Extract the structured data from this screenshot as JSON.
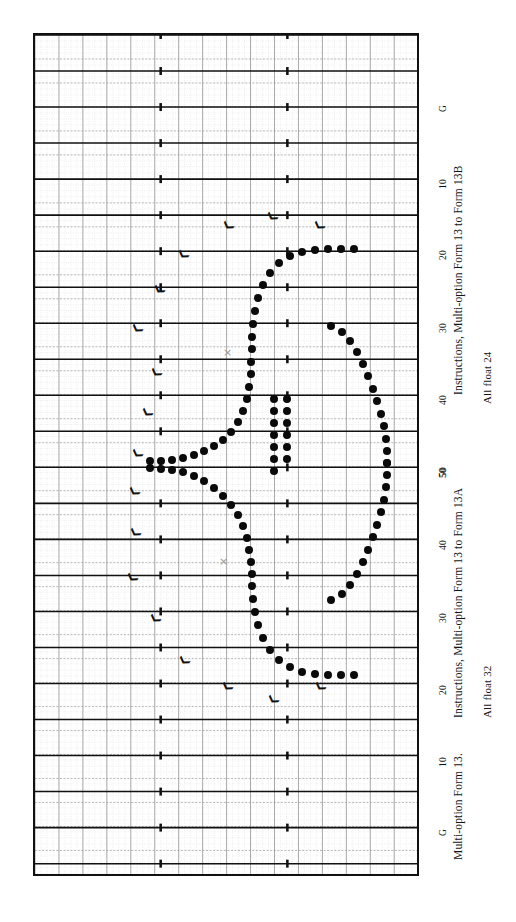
{
  "figure": {
    "orientation": "rotated-90",
    "paper": "graph-paper",
    "colors": {
      "frame": "#111111",
      "major_grid": "#111111",
      "minor_grid": "#8d8d8d",
      "fine_grid": "#c9c9c9",
      "dot": "#0a0a0a",
      "xmark": "#9a9a9a",
      "background": "#ffffff"
    }
  },
  "captions": [
    {
      "id": "cap-13b",
      "text": "Instructions, Multi-option Form 13 to Form 13B",
      "x": 452,
      "y": 395
    },
    {
      "id": "float-24",
      "text": "All float 24",
      "x": 481,
      "y": 404
    },
    {
      "id": "cap-13a",
      "text": "Instructions, Multi-option Form 13 to Form 13A",
      "x": 452,
      "y": 718
    },
    {
      "id": "float-32",
      "text": "All float 32",
      "x": 481,
      "y": 718
    },
    {
      "id": "cap-13",
      "text": "Multi-option Form 13.",
      "x": 452,
      "y": 860
    }
  ],
  "axis": {
    "name": "time-axis",
    "ticks": [
      {
        "label": "G",
        "y": 107
      },
      {
        "label": "10",
        "y": 181
      },
      {
        "label": "20",
        "y": 252
      },
      {
        "label": "30",
        "y": 325
      },
      {
        "label": "40",
        "y": 397
      },
      {
        "label": "50",
        "y": 469
      },
      {
        "label": "50",
        "y": 470
      },
      {
        "label": "40",
        "y": 542
      },
      {
        "label": "30",
        "y": 615
      },
      {
        "label": "20",
        "y": 687
      },
      {
        "label": "10",
        "y": 759
      },
      {
        "label": "G",
        "y": 831
      }
    ]
  },
  "chart_data": {
    "type": "scatter",
    "xlabel": "",
    "ylabel": "",
    "grid": true,
    "legend": "none",
    "axis_tick_labels": [
      "G",
      "10",
      "20",
      "30",
      "40",
      "50",
      "50",
      "40",
      "30",
      "20",
      "10",
      "G"
    ],
    "series": [
      {
        "name": "form-13b-curve",
        "marker": "filled-circle",
        "points": [
          [
            352,
            247
          ],
          [
            339,
            247
          ],
          [
            326,
            247
          ],
          [
            313,
            248
          ],
          [
            300,
            250
          ],
          [
            288,
            254
          ],
          [
            277,
            261
          ],
          [
            268,
            271
          ],
          [
            261,
            283
          ],
          [
            256,
            296
          ],
          [
            253,
            309
          ],
          [
            251,
            322
          ],
          [
            250,
            335
          ],
          [
            250,
            347
          ],
          [
            249,
            360
          ],
          [
            249,
            372
          ],
          [
            247,
            385
          ],
          [
            245,
            397
          ],
          [
            241,
            409
          ],
          [
            236,
            420
          ],
          [
            229,
            430
          ],
          [
            221,
            438
          ],
          [
            212,
            444
          ],
          [
            202,
            449
          ],
          [
            192,
            453
          ],
          [
            181,
            456
          ],
          [
            170,
            458
          ],
          [
            159,
            459
          ],
          [
            148,
            459
          ]
        ]
      },
      {
        "name": "form-13b-return",
        "marker": "filled-circle",
        "points": [
          [
            329,
            324
          ],
          [
            340,
            330
          ],
          [
            348,
            339
          ],
          [
            355,
            350
          ],
          [
            361,
            362
          ],
          [
            366,
            374
          ],
          [
            371,
            387
          ],
          [
            375,
            399
          ],
          [
            379,
            412
          ],
          [
            382,
            424
          ],
          [
            384,
            437
          ],
          [
            385,
            449
          ],
          [
            385,
            461
          ]
        ]
      },
      {
        "name": "form-13a-curve",
        "marker": "filled-circle",
        "points": [
          [
            148,
            466
          ],
          [
            159,
            467
          ],
          [
            170,
            468
          ],
          [
            181,
            470
          ],
          [
            192,
            474
          ],
          [
            202,
            479
          ],
          [
            212,
            486
          ],
          [
            221,
            494
          ],
          [
            229,
            503
          ],
          [
            236,
            513
          ],
          [
            241,
            524
          ],
          [
            245,
            536
          ],
          [
            247,
            548
          ],
          [
            249,
            560
          ],
          [
            250,
            572
          ],
          [
            250,
            584
          ],
          [
            251,
            597
          ],
          [
            253,
            610
          ],
          [
            256,
            623
          ],
          [
            261,
            636
          ],
          [
            268,
            648
          ],
          [
            277,
            658
          ],
          [
            288,
            665
          ],
          [
            300,
            670
          ],
          [
            313,
            672
          ],
          [
            326,
            673
          ],
          [
            339,
            673
          ],
          [
            352,
            673
          ]
        ]
      },
      {
        "name": "form-13a-return",
        "marker": "filled-circle",
        "points": [
          [
            385,
            461
          ],
          [
            385,
            473
          ],
          [
            384,
            485
          ],
          [
            382,
            498
          ],
          [
            379,
            510
          ],
          [
            375,
            523
          ],
          [
            371,
            535
          ],
          [
            366,
            548
          ],
          [
            361,
            560
          ],
          [
            355,
            572
          ],
          [
            348,
            583
          ],
          [
            340,
            592
          ],
          [
            329,
            598
          ]
        ]
      },
      {
        "name": "inner-branch-upper",
        "marker": "filled-circle",
        "points": [
          [
            272,
            397
          ],
          [
            272,
            409
          ],
          [
            272,
            421
          ],
          [
            272,
            433
          ],
          [
            272,
            445
          ],
          [
            272,
            457
          ],
          [
            272,
            469
          ]
        ]
      },
      {
        "name": "inner-branch-lower",
        "marker": "filled-circle",
        "points": [
          [
            285,
            397
          ],
          [
            285,
            409
          ],
          [
            285,
            421
          ],
          [
            285,
            433
          ],
          [
            285,
            445
          ],
          [
            285,
            457
          ]
        ]
      }
    ],
    "markers": {
      "chevrons": [
        {
          "x": 269,
          "y": 215
        },
        {
          "x": 316,
          "y": 224
        },
        {
          "x": 225,
          "y": 224
        },
        {
          "x": 180,
          "y": 253
        },
        {
          "x": 156,
          "y": 288
        },
        {
          "x": 134,
          "y": 327
        },
        {
          "x": 153,
          "y": 371
        },
        {
          "x": 144,
          "y": 411
        },
        {
          "x": 134,
          "y": 452
        },
        {
          "x": 131,
          "y": 490
        },
        {
          "x": 132,
          "y": 531
        },
        {
          "x": 129,
          "y": 576
        },
        {
          "x": 152,
          "y": 617
        },
        {
          "x": 181,
          "y": 659
        },
        {
          "x": 224,
          "y": 685
        },
        {
          "x": 317,
          "y": 685
        },
        {
          "x": 270,
          "y": 698
        }
      ],
      "x_marks": [
        {
          "x": 225,
          "y": 351
        },
        {
          "x": 221,
          "y": 560
        }
      ]
    }
  }
}
